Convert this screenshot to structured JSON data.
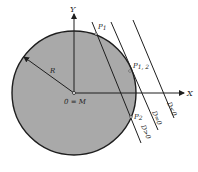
{
  "colors": {
    "disk_fill": "#a9a9a9",
    "stroke": "#1e1e1e",
    "background": "#ffffff"
  },
  "labels": {
    "y_axis": "Y",
    "x_axis": "X",
    "radius": "R",
    "origin": "0 = M",
    "p1": "P",
    "p1_sub": "1",
    "p12": "P",
    "p12_sub": "1, 2",
    "p2": "P",
    "p2_sub": "2",
    "d_less": "D<0",
    "d_equal": "D=0",
    "d_greater": "D>0"
  }
}
